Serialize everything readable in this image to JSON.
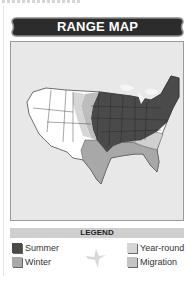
{
  "header": {
    "title": "RANGE MAP"
  },
  "map": {
    "region": "Contiguous United States",
    "colors": {
      "summer": "#4a4a4a",
      "winter": "#a8a8a8",
      "year_round": "#cfcfcf",
      "migration": "#bdbdbd",
      "none": "#ffffff",
      "background": "#e8e8e8"
    }
  },
  "legend": {
    "title": "LEGEND",
    "items": [
      {
        "label": "Summer",
        "color": "#4a4a4a"
      },
      {
        "label": "Winter",
        "color": "#a8a8a8"
      },
      {
        "label": "Year-round",
        "color": "#d6d6d6"
      },
      {
        "label": "Migration",
        "color": "#c4c4c4"
      }
    ],
    "icon": "bird-silhouette-icon"
  }
}
